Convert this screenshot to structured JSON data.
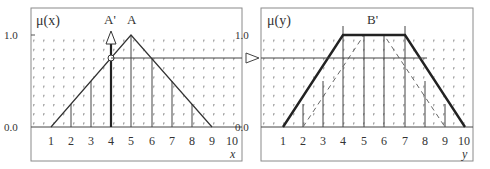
{
  "left_chart": {
    "y_axis_label": "μ(x)",
    "x_axis_label": "x",
    "y_ticks": [
      "1.0",
      "0.0"
    ],
    "x_ticks": [
      "1",
      "2",
      "3",
      "4",
      "5",
      "6",
      "7",
      "8",
      "9",
      "10"
    ],
    "set_label": "A",
    "input_label": "A'",
    "set_A": {
      "shape": "triangle",
      "points": [
        [
          1,
          0
        ],
        [
          5,
          1
        ],
        [
          9,
          0
        ]
      ]
    },
    "bars": [
      {
        "x": 2,
        "mu": 0.25
      },
      {
        "x": 3,
        "mu": 0.5
      },
      {
        "x": 4,
        "mu": 0.75
      },
      {
        "x": 5,
        "mu": 1.0
      },
      {
        "x": 6,
        "mu": 0.75
      },
      {
        "x": 7,
        "mu": 0.5
      },
      {
        "x": 8,
        "mu": 0.25
      }
    ],
    "input_singleton": {
      "x": 4,
      "mu": 0.75
    }
  },
  "right_chart": {
    "y_axis_label": "μ(y)",
    "x_axis_label": "y",
    "y_ticks": [
      "1.0",
      "0.0"
    ],
    "x_ticks": [
      "1",
      "2",
      "3",
      "4",
      "5",
      "6",
      "7",
      "8",
      "9",
      "10"
    ],
    "output_label": "B'",
    "set_B_dashed": {
      "shape": "trapezoid",
      "points": [
        [
          2,
          0
        ],
        [
          5,
          1
        ],
        [
          6,
          1
        ],
        [
          9,
          0
        ]
      ]
    },
    "set_B_prime": {
      "shape": "trapezoid",
      "points": [
        [
          1,
          0
        ],
        [
          4,
          1
        ],
        [
          7,
          1
        ],
        [
          10,
          0
        ]
      ]
    },
    "bars": [
      {
        "y": 2,
        "mu": 0.25
      },
      {
        "y": 3,
        "mu": 0.5
      },
      {
        "y": 4,
        "mu": 1.0
      },
      {
        "y": 5,
        "mu": 1.0
      },
      {
        "y": 6,
        "mu": 1.0
      },
      {
        "y": 7,
        "mu": 1.0
      },
      {
        "y": 8,
        "mu": 0.5
      },
      {
        "y": 9,
        "mu": 0.25
      }
    ]
  },
  "threshold_line": {
    "mu": 0.75
  }
}
